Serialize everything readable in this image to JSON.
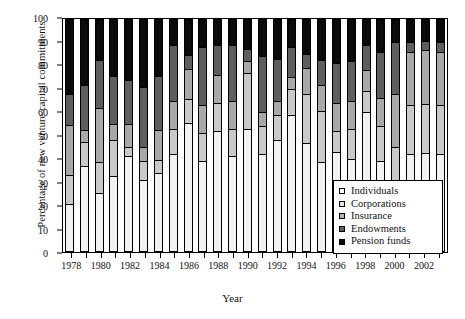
{
  "chart_data": {
    "type": "bar",
    "subtype": "stacked-bar-100",
    "title": "",
    "xlabel": "Year",
    "ylabel": "Percentage of new venture capital commitments",
    "ylim": [
      0,
      100
    ],
    "yticks": [
      0,
      10,
      20,
      30,
      40,
      50,
      60,
      70,
      80,
      90,
      100
    ],
    "grid": false,
    "legend_position": "inside-bottom-right",
    "categories": [
      "1978",
      "1979",
      "1980",
      "1981",
      "1982",
      "1983",
      "1984",
      "1985",
      "1986",
      "1987",
      "1988",
      "1989",
      "1990",
      "1991",
      "1992",
      "1993",
      "1994",
      "1995",
      "1996",
      "1997",
      "1998",
      "1999",
      "2000",
      "2001",
      "2002",
      "2003"
    ],
    "xtick_labels": [
      "1978",
      "1980",
      "1982",
      "1984",
      "1986",
      "1988",
      "1990",
      "1992",
      "1994",
      "1996",
      "1998",
      "2000",
      "2002"
    ],
    "series": [
      {
        "name": "Pension funds",
        "color": "#0a0a0a",
        "values": [
          20.5,
          37,
          25.5,
          32.5,
          41,
          31,
          34,
          42,
          55.5,
          39,
          52,
          41,
          53,
          42,
          48,
          59,
          47,
          38.5,
          43,
          40,
          60,
          39,
          23,
          42,
          42.5,
          42
        ]
      },
      {
        "name": "Endowments",
        "color": "#5e5e5e",
        "values": [
          12.5,
          10,
          13,
          15.5,
          4,
          8,
          5.5,
          11,
          10,
          12,
          12,
          12,
          24,
          12,
          11,
          11,
          21,
          22,
          9,
          13,
          9,
          15,
          22,
          21,
          21,
          21
        ]
      },
      {
        "name": "Insurance",
        "color": "#a8a8a6",
        "values": [
          21.5,
          5.5,
          23.5,
          7,
          10,
          6,
          13,
          12,
          13,
          12,
          12,
          12,
          5,
          6,
          6,
          5,
          11,
          11,
          12,
          12,
          9,
          12,
          23,
          23,
          23,
          23
        ]
      },
      {
        "name": "Corporations",
        "color": "#c9c9c7",
        "values": [
          13.5,
          19,
          20.5,
          20.5,
          19,
          26,
          23,
          24,
          6,
          25,
          13,
          24,
          5,
          24,
          18,
          13,
          6,
          11,
          17,
          17,
          11,
          20,
          22,
          4,
          4,
          4
        ]
      },
      {
        "name": "Individuals",
        "color": "#f2f2f0",
        "values": [
          32,
          28.5,
          17.5,
          24.5,
          26,
          29,
          24.5,
          11,
          15.5,
          12,
          11,
          11,
          13,
          16,
          17,
          12,
          15,
          17.5,
          19,
          18,
          11,
          14,
          10,
          10,
          9.5,
          10
        ]
      }
    ],
    "legend": [
      {
        "label": "Individuals",
        "swatch": "#ffffff"
      },
      {
        "label": "Corporations",
        "swatch": "#e6e6e4"
      },
      {
        "label": "Insurance",
        "swatch": "#b5b5b3"
      },
      {
        "label": "Endowments",
        "swatch": "#5e5e5e"
      },
      {
        "label": "Pension funds",
        "swatch": "#0a0a0a"
      }
    ]
  }
}
